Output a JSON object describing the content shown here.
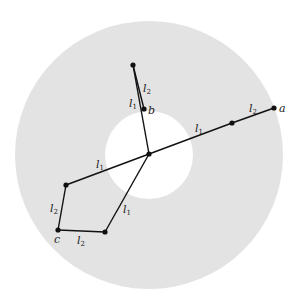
{
  "diagram": {
    "type": "two-link robot arm workspace (annulus)",
    "colors": {
      "workspace": "#e3e3e3",
      "background": "#ffffff",
      "link": "#111111"
    },
    "workspace": {
      "center": [
        149,
        155
      ],
      "outer_radius": 134,
      "inner_radius": 44
    },
    "base_joint": [
      149,
      154
    ],
    "configurations": [
      {
        "target_label": "a",
        "elbow": [
          232,
          123
        ],
        "end": [
          274,
          108
        ],
        "link1_label_pos": [
          196,
          132
        ],
        "link2_label_pos": [
          250,
          110
        ],
        "target_label_pos": [
          279,
          111
        ]
      },
      {
        "target_label": "b",
        "elbow": [
          133,
          65
        ],
        "end": [
          144,
          109
        ],
        "link1_label_pos": [
          128,
          112
        ],
        "link2_label_pos": [
          143,
          92
        ],
        "target_label_pos": [
          148,
          114
        ]
      },
      {
        "target_label": "c",
        "elbow_upper": [
          66,
          185
        ],
        "elbow_lower": [
          105,
          232
        ],
        "end": [
          58,
          230
        ],
        "link1_label_upper_pos": [
          95,
          168
        ],
        "link1_label_lower_pos": [
          122,
          215
        ],
        "link2_label_left_pos": [
          49,
          210
        ],
        "link2_label_bottom_pos": [
          78,
          244
        ],
        "target_label_pos": [
          55,
          242
        ]
      }
    ],
    "labels": {
      "l": "l",
      "sub1": "1",
      "sub2": "2",
      "a": "a",
      "b": "b",
      "c": "c"
    }
  }
}
